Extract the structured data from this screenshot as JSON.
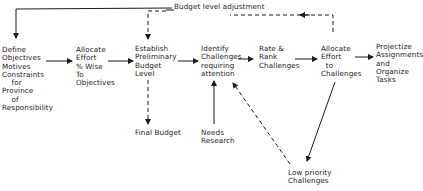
{
  "diagram": {
    "feedback_label": "Budget level adjustment",
    "nodes": {
      "define": "Define\nObjectives\nMotives\nConstraints\n    for\nProvince\n    of\nResponsibility",
      "allocate_obj": "Allocate\nEffort\n% Wise\nTo\nObjectives",
      "establish": "Establish\nPreliminary\nBudget\nLevel",
      "identify": "Identify\nChallenges\nrequiring\nattention",
      "rate": "Rate &\nRank\nChallenges",
      "allocate_ch": "Allocate\nEffort\n  to\nChallenges",
      "projectize": "Projectize\nAssignments\nand\nOrganize\nTasks",
      "final_budget": "Final Budget",
      "needs_research": "Needs\nResearch",
      "low_priority": "Low priority\nChallenges"
    },
    "colors": {
      "line": "#1a1a1a",
      "background": "#ffffff"
    }
  }
}
